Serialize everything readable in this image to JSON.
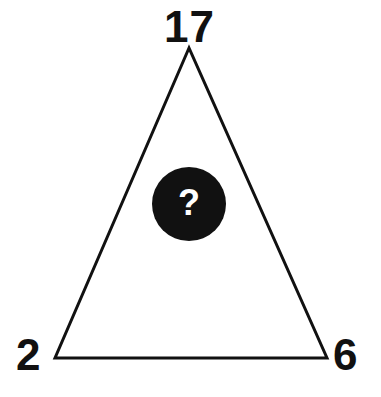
{
  "puzzle": {
    "shape": "triangle",
    "vertices": {
      "top": "17",
      "bottom_left": "2",
      "bottom_right": "6"
    },
    "center": {
      "icon": "question-mark-circle-icon",
      "glyph": "?"
    },
    "colors": {
      "stroke": "#111111",
      "fill": "#ffffff",
      "circle": "#111111",
      "glyph": "#ffffff",
      "background": "#ffffff"
    }
  }
}
